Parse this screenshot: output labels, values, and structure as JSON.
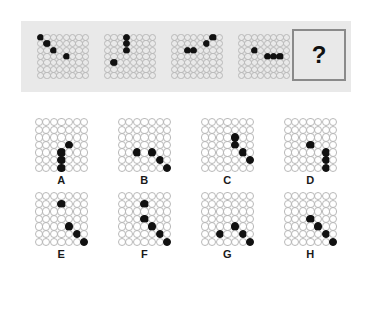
{
  "puzzle": {
    "type": "matrix-reasoning-dot-grid",
    "question_mark": "?",
    "stem": {
      "grid": {
        "cols": 8,
        "rows": 7
      },
      "panels": [
        {
          "name": "stem-panel-1",
          "filled": [
            [
              0,
              0
            ],
            [
              1,
              1
            ],
            [
              2,
              2
            ],
            [
              4,
              3
            ]
          ]
        },
        {
          "name": "stem-panel-2",
          "filled": [
            [
              3,
              0
            ],
            [
              3,
              1
            ],
            [
              3,
              2
            ],
            [
              1,
              4
            ]
          ]
        },
        {
          "name": "stem-panel-3",
          "filled": [
            [
              6,
              0
            ],
            [
              5,
              1
            ],
            [
              3,
              2
            ],
            [
              2,
              2
            ]
          ]
        },
        {
          "name": "stem-panel-4",
          "filled": [
            [
              2,
              2
            ],
            [
              4,
              3
            ],
            [
              5,
              3
            ],
            [
              6,
              3
            ]
          ]
        }
      ]
    },
    "options": {
      "grid": {
        "cols": 7,
        "rows": 7
      },
      "items": [
        {
          "label": "A",
          "filled": [
            [
              4,
              3
            ],
            [
              3,
              4
            ],
            [
              3,
              5
            ],
            [
              3,
              6
            ]
          ]
        },
        {
          "label": "B",
          "filled": [
            [
              2,
              4
            ],
            [
              4,
              4
            ],
            [
              5,
              5
            ],
            [
              6,
              6
            ]
          ]
        },
        {
          "label": "C",
          "filled": [
            [
              4,
              2
            ],
            [
              4,
              3
            ],
            [
              5,
              4
            ],
            [
              6,
              5
            ]
          ]
        },
        {
          "label": "D",
          "filled": [
            [
              3,
              3
            ],
            [
              5,
              4
            ],
            [
              5,
              5
            ],
            [
              5,
              6
            ]
          ]
        },
        {
          "label": "E",
          "filled": [
            [
              3,
              1
            ],
            [
              4,
              4
            ],
            [
              5,
              5
            ],
            [
              6,
              6
            ]
          ]
        },
        {
          "label": "F",
          "filled": [
            [
              3,
              1
            ],
            [
              3,
              3
            ],
            [
              4,
              4
            ],
            [
              5,
              5
            ],
            [
              6,
              6
            ]
          ]
        },
        {
          "label": "G",
          "filled": [
            [
              2,
              5
            ],
            [
              4,
              4
            ],
            [
              5,
              5
            ],
            [
              6,
              6
            ]
          ]
        },
        {
          "label": "H",
          "filled": [
            [
              3,
              3
            ],
            [
              4,
              4
            ],
            [
              5,
              5
            ],
            [
              6,
              6
            ]
          ]
        }
      ]
    }
  }
}
